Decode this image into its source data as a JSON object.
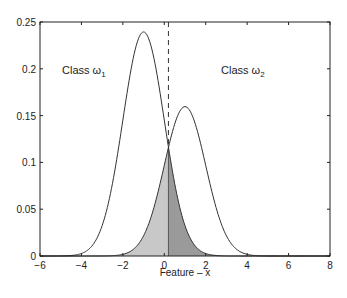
{
  "chart_data": {
    "type": "line",
    "title": "",
    "xlabel": "Feature – x",
    "ylabel": "",
    "xlim": [
      -6,
      8
    ],
    "ylim": [
      0,
      0.25
    ],
    "grid": false,
    "xticks": [
      "-6",
      "-4",
      "-2",
      "0",
      "2",
      "4",
      "6",
      "8"
    ],
    "xtick_values": [
      -6,
      -4,
      -2,
      0,
      2,
      4,
      6,
      8
    ],
    "yticks": [
      "0",
      "0.05",
      "0.1",
      "0.15",
      "0.2",
      "0.25"
    ],
    "ytick_values": [
      0,
      0.05,
      0.1,
      0.15,
      0.2,
      0.25
    ],
    "series": [
      {
        "name": "Class ω1",
        "mean": -1,
        "std": 1,
        "weight": 0.6,
        "peak": 0.24,
        "peak_x": -1
      },
      {
        "name": "Class ω2",
        "mean": 1,
        "std": 1,
        "weight": 0.4,
        "peak": 0.16,
        "peak_x": 1
      }
    ],
    "threshold": {
      "x": 0.2,
      "style": "dashed",
      "intersection_y": 0.115
    },
    "shaded_regions": [
      {
        "name": "class-2-error-left-of-threshold",
        "under": "Class ω2",
        "range": [
          -6,
          0.2
        ],
        "color": "#c8c8c8"
      },
      {
        "name": "class-1-error-right-of-threshold",
        "under": "Class ω1",
        "range": [
          0.2,
          8
        ],
        "color": "#9a9a9a"
      }
    ],
    "annotations": [
      {
        "text": "Class ω",
        "subscript": "1",
        "x": -4.5,
        "y": 0.2
      },
      {
        "text": "Class ω",
        "subscript": "2",
        "x": 2.6,
        "y": 0.2
      }
    ]
  },
  "labels": {
    "xlabel": "Feature – x",
    "class1_text": "Class ω",
    "class1_sub": "1",
    "class2_text": "Class ω",
    "class2_sub": "2"
  },
  "colors": {
    "curve": "#333333",
    "axis": "#222222",
    "shade_light": "#c8c8c8",
    "shade_dark": "#9a9a9a"
  }
}
